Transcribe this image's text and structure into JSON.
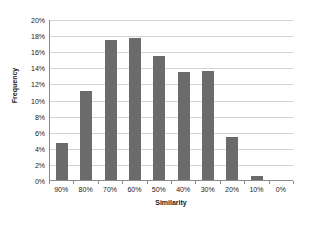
{
  "chart_data": {
    "type": "bar",
    "title": "",
    "xlabel": "Similarity",
    "ylabel": "Frequency",
    "categories": [
      "90%",
      "80%",
      "70%",
      "60%",
      "50%",
      "40%",
      "30%",
      "20%",
      "10%",
      "0%"
    ],
    "values": [
      4.6,
      11.0,
      17.4,
      17.7,
      15.4,
      13.4,
      13.5,
      5.4,
      0.5,
      0.0
    ],
    "value_labels": [
      "4.6%",
      "11.0%",
      "17.4%",
      "17.7%",
      "15.4%",
      "13.4%",
      "13.5%",
      "5.4%",
      "0.5%",
      "0.0%"
    ],
    "ylim": [
      0,
      20
    ],
    "ytick_step": 2,
    "ytick_labels": [
      "20%",
      "18%",
      "16%",
      "14%",
      "12%",
      "10%",
      "8%",
      "6%",
      "4%",
      "2%",
      "0%"
    ],
    "ytick_values": [
      20,
      18,
      16,
      14,
      12,
      10,
      8,
      6,
      4,
      2,
      0
    ],
    "grid": true,
    "grid_axis": "y",
    "legend": false,
    "legend_position": "none",
    "series": [
      {
        "name": "Frequency",
        "color": "#6b6b6b",
        "values": [
          4.6,
          11.0,
          17.4,
          17.7,
          15.4,
          13.4,
          13.5,
          5.4,
          0.5,
          0.0
        ]
      }
    ],
    "colors": {
      "bar": "#6b6b6b",
      "gridline": "#d2d2d2",
      "axis": "#8a8a8a",
      "text": "#1a1a1a",
      "background": "#ffffff"
    }
  }
}
